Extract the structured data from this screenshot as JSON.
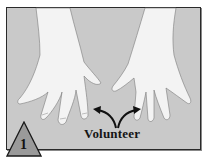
{
  "illustration": {
    "subject": "two hands, palms down, fingers spread",
    "label": "Volunteer",
    "step_number": "1",
    "colors": {
      "background": "#c9c9c9",
      "skin": "#f2f2f2",
      "outline": "#2a2a2a",
      "badge_fill": "#9a9a9a"
    }
  }
}
